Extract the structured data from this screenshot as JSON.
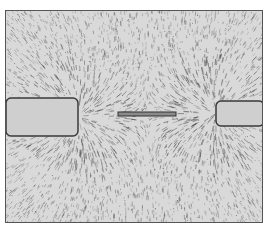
{
  "image": {
    "description": "Iron filings photograph showing magnetic field lines around two bar magnet poles with a small iron bar between them",
    "colors": {
      "background": "#d9d9d9",
      "filings": "#4a4a4a",
      "magnet": "#cfcfcf",
      "border": "#555555"
    },
    "objects": [
      {
        "name": "left-magnet",
        "x": 0,
        "y": 87,
        "w": 72,
        "h": 38
      },
      {
        "name": "right-magnet",
        "x": 210,
        "y": 90,
        "w": 48,
        "h": 25
      },
      {
        "name": "center-bar",
        "x": 112,
        "y": 101,
        "w": 58,
        "h": 4
      }
    ]
  }
}
